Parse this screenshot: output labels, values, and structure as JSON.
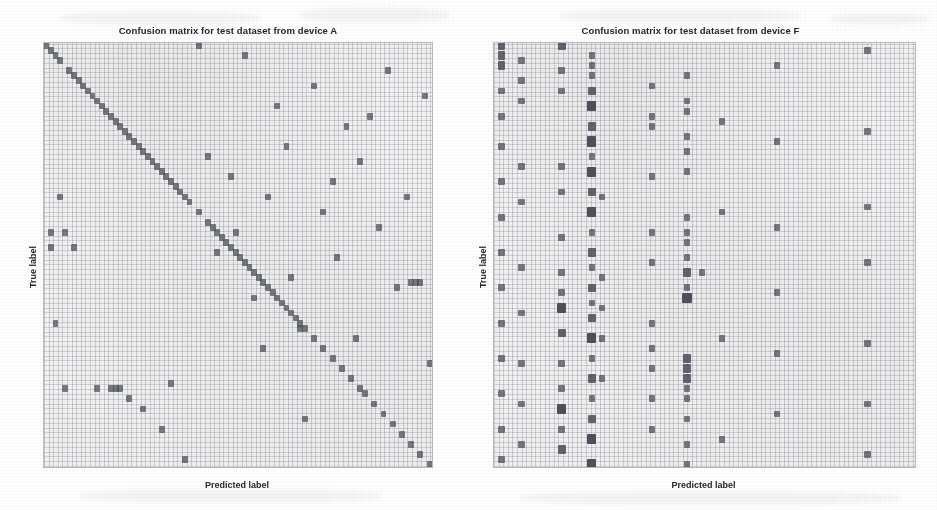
{
  "figure": {
    "background_color": "#ffffff",
    "cell_color": "#4a4e57",
    "grid_color": "#b9bcc1",
    "plot_face_color": "#f6f6f6"
  },
  "panels": [
    {
      "id": "panel-a",
      "title": "Confusion matrix for test dataset from device A",
      "xlabel": "Predicted label",
      "ylabel": "True label"
    },
    {
      "id": "panel-f",
      "title": "Confusion matrix for test dataset from device F",
      "xlabel": "Predicted label",
      "ylabel": "True label"
    }
  ],
  "chart_data": [
    {
      "type": "heatmap",
      "title": "Confusion matrix for test dataset from device A",
      "xlabel": "Predicted label",
      "ylabel": "True label",
      "grid": true,
      "legend": "none",
      "xtick_labels": [],
      "ytick_labels": [],
      "n_classes": 84,
      "xlim": [
        0,
        84
      ],
      "ylim": [
        0,
        84
      ],
      "value_scale": "counts (dark = higher)",
      "description": "Strong dark main diagonal indicating mostly correct predictions, with sparse scattered off-diagonal confusions.",
      "points": [
        [
          0,
          0,
          1
        ],
        [
          1,
          1,
          1
        ],
        [
          2,
          2,
          1
        ],
        [
          3,
          3,
          1
        ],
        [
          5,
          5,
          1
        ],
        [
          6,
          6,
          1
        ],
        [
          7,
          7,
          1
        ],
        [
          8,
          8,
          1
        ],
        [
          9,
          9,
          1
        ],
        [
          10,
          10,
          1
        ],
        [
          11,
          11,
          1
        ],
        [
          12,
          12,
          1
        ],
        [
          13,
          13,
          1
        ],
        [
          14,
          14,
          1
        ],
        [
          15,
          15,
          1
        ],
        [
          16,
          16,
          1
        ],
        [
          17,
          17,
          1
        ],
        [
          18,
          18,
          1
        ],
        [
          19,
          19,
          1
        ],
        [
          20,
          20,
          1
        ],
        [
          21,
          21,
          1
        ],
        [
          22,
          22,
          1
        ],
        [
          23,
          23,
          1
        ],
        [
          24,
          24,
          1
        ],
        [
          25,
          25,
          1
        ],
        [
          26,
          26,
          1
        ],
        [
          27,
          27,
          1
        ],
        [
          28,
          28,
          1
        ],
        [
          29,
          29,
          1
        ],
        [
          30,
          30,
          1
        ],
        [
          31,
          31,
          1
        ],
        [
          33,
          33,
          1
        ],
        [
          35,
          35,
          1
        ],
        [
          36,
          36,
          1
        ],
        [
          37,
          37,
          1
        ],
        [
          38,
          38,
          1
        ],
        [
          39,
          39,
          1
        ],
        [
          40,
          40,
          1
        ],
        [
          41,
          41,
          1
        ],
        [
          42,
          42,
          1
        ],
        [
          43,
          43,
          1
        ],
        [
          44,
          44,
          1
        ],
        [
          45,
          45,
          1
        ],
        [
          46,
          46,
          1
        ],
        [
          47,
          47,
          1
        ],
        [
          48,
          48,
          1
        ],
        [
          49,
          49,
          1
        ],
        [
          50,
          50,
          1
        ],
        [
          51,
          51,
          1
        ],
        [
          52,
          52,
          1
        ],
        [
          53,
          53,
          1
        ],
        [
          54,
          54,
          1
        ],
        [
          55,
          55,
          1
        ],
        [
          56,
          56,
          1
        ],
        [
          58,
          58,
          1
        ],
        [
          60,
          60,
          1
        ],
        [
          62,
          62,
          1
        ],
        [
          64,
          64,
          1
        ],
        [
          66,
          66,
          1
        ],
        [
          68,
          68,
          1
        ],
        [
          69,
          69,
          1
        ],
        [
          71,
          71,
          1
        ],
        [
          73,
          73,
          1
        ],
        [
          75,
          75,
          1
        ],
        [
          77,
          77,
          1
        ],
        [
          79,
          79,
          1
        ],
        [
          81,
          81,
          1
        ],
        [
          83,
          83,
          1
        ],
        [
          1,
          37,
          1
        ],
        [
          1,
          40,
          1
        ],
        [
          2,
          55,
          1
        ],
        [
          3,
          30,
          1
        ],
        [
          4,
          68,
          1
        ],
        [
          4,
          37,
          1
        ],
        [
          6,
          40,
          1
        ],
        [
          11,
          68,
          1
        ],
        [
          14,
          68,
          1
        ],
        [
          15,
          68,
          1
        ],
        [
          16,
          68,
          1
        ],
        [
          18,
          70,
          1
        ],
        [
          21,
          72,
          1
        ],
        [
          25,
          76,
          1
        ],
        [
          27,
          67,
          1
        ],
        [
          30,
          82,
          1
        ],
        [
          33,
          0,
          1
        ],
        [
          35,
          22,
          1
        ],
        [
          37,
          41,
          1
        ],
        [
          40,
          26,
          1
        ],
        [
          41,
          37,
          1
        ],
        [
          43,
          2,
          1
        ],
        [
          45,
          50,
          1
        ],
        [
          47,
          60,
          1
        ],
        [
          48,
          30,
          1
        ],
        [
          50,
          12,
          1
        ],
        [
          52,
          20,
          1
        ],
        [
          53,
          46,
          1
        ],
        [
          55,
          56,
          1
        ],
        [
          56,
          74,
          1
        ],
        [
          58,
          8,
          1
        ],
        [
          60,
          33,
          1
        ],
        [
          62,
          27,
          1
        ],
        [
          63,
          42,
          1
        ],
        [
          65,
          16,
          1
        ],
        [
          67,
          58,
          1
        ],
        [
          68,
          23,
          1
        ],
        [
          70,
          14,
          1
        ],
        [
          72,
          36,
          1
        ],
        [
          74,
          5,
          1
        ],
        [
          76,
          48,
          1
        ],
        [
          78,
          30,
          1
        ],
        [
          79,
          47,
          1
        ],
        [
          80,
          47,
          1
        ],
        [
          81,
          47,
          1
        ],
        [
          82,
          10,
          1
        ],
        [
          83,
          63,
          1
        ]
      ]
    },
    {
      "type": "heatmap",
      "title": "Confusion matrix for test dataset from device F",
      "xlabel": "Predicted label",
      "ylabel": "True label",
      "grid": true,
      "legend": "none",
      "xtick_labels": [],
      "ytick_labels": [],
      "n_classes": 84,
      "xlim": [
        0,
        84
      ],
      "ylim": [
        0,
        84
      ],
      "value_scale": "counts (dark = higher)",
      "description": "No visible diagonal; predictions collapse onto a small number of columns producing dense dark vertical bands, indicating severe domain shift / misclassification.",
      "dominant_predicted_columns": [
        1,
        5,
        13,
        19,
        21,
        31,
        38,
        45,
        56,
        74
      ],
      "points": [
        [
          1,
          0,
          2
        ],
        [
          1,
          2,
          2
        ],
        [
          1,
          4,
          2
        ],
        [
          1,
          9,
          1
        ],
        [
          1,
          14,
          1
        ],
        [
          1,
          20,
          1
        ],
        [
          1,
          27,
          1
        ],
        [
          1,
          34,
          1
        ],
        [
          1,
          41,
          1
        ],
        [
          1,
          48,
          1
        ],
        [
          1,
          55,
          1
        ],
        [
          1,
          62,
          1
        ],
        [
          1,
          69,
          1
        ],
        [
          1,
          76,
          1
        ],
        [
          1,
          82,
          1
        ],
        [
          5,
          3,
          1
        ],
        [
          5,
          7,
          1
        ],
        [
          5,
          11,
          1
        ],
        [
          5,
          24,
          1
        ],
        [
          5,
          31,
          1
        ],
        [
          5,
          44,
          1
        ],
        [
          5,
          53,
          1
        ],
        [
          5,
          63,
          1
        ],
        [
          5,
          71,
          1
        ],
        [
          5,
          79,
          1
        ],
        [
          13,
          0,
          2
        ],
        [
          13,
          5,
          1
        ],
        [
          13,
          9,
          1
        ],
        [
          13,
          24,
          1
        ],
        [
          13,
          29,
          1
        ],
        [
          13,
          38,
          1
        ],
        [
          13,
          45,
          1
        ],
        [
          13,
          49,
          1
        ],
        [
          13,
          52,
          3
        ],
        [
          13,
          57,
          2
        ],
        [
          13,
          63,
          1
        ],
        [
          13,
          68,
          1
        ],
        [
          13,
          72,
          3
        ],
        [
          13,
          76,
          1
        ],
        [
          13,
          80,
          2
        ],
        [
          19,
          2,
          1
        ],
        [
          19,
          4,
          1
        ],
        [
          19,
          6,
          1
        ],
        [
          19,
          9,
          2
        ],
        [
          19,
          12,
          3
        ],
        [
          19,
          16,
          2
        ],
        [
          19,
          19,
          3
        ],
        [
          19,
          22,
          1
        ],
        [
          19,
          25,
          3
        ],
        [
          19,
          29,
          2
        ],
        [
          19,
          33,
          3
        ],
        [
          19,
          37,
          1
        ],
        [
          19,
          41,
          2
        ],
        [
          19,
          44,
          1
        ],
        [
          19,
          48,
          2
        ],
        [
          19,
          51,
          1
        ],
        [
          19,
          54,
          2
        ],
        [
          19,
          58,
          3
        ],
        [
          19,
          62,
          1
        ],
        [
          19,
          66,
          2
        ],
        [
          19,
          70,
          1
        ],
        [
          19,
          74,
          2
        ],
        [
          19,
          78,
          3
        ],
        [
          19,
          83,
          3
        ],
        [
          21,
          30,
          1
        ],
        [
          21,
          46,
          1
        ],
        [
          21,
          52,
          1
        ],
        [
          21,
          58,
          1
        ],
        [
          21,
          66,
          1
        ],
        [
          31,
          8,
          1
        ],
        [
          31,
          14,
          1
        ],
        [
          31,
          16,
          1
        ],
        [
          31,
          26,
          1
        ],
        [
          31,
          37,
          1
        ],
        [
          31,
          43,
          1
        ],
        [
          31,
          55,
          1
        ],
        [
          31,
          60,
          1
        ],
        [
          31,
          64,
          1
        ],
        [
          31,
          70,
          1
        ],
        [
          31,
          76,
          1
        ],
        [
          38,
          6,
          1
        ],
        [
          38,
          11,
          1
        ],
        [
          38,
          13,
          1
        ],
        [
          38,
          18,
          1
        ],
        [
          38,
          21,
          1
        ],
        [
          38,
          25,
          1
        ],
        [
          38,
          34,
          1
        ],
        [
          38,
          37,
          1
        ],
        [
          38,
          39,
          1
        ],
        [
          38,
          42,
          1
        ],
        [
          38,
          45,
          2
        ],
        [
          38,
          48,
          1
        ],
        [
          38,
          50,
          3
        ],
        [
          38,
          62,
          2
        ],
        [
          38,
          64,
          2
        ],
        [
          38,
          66,
          2
        ],
        [
          38,
          68,
          1
        ],
        [
          38,
          70,
          1
        ],
        [
          38,
          74,
          1
        ],
        [
          38,
          79,
          1
        ],
        [
          38,
          83,
          1
        ],
        [
          41,
          45,
          1
        ],
        [
          45,
          15,
          1
        ],
        [
          45,
          33,
          1
        ],
        [
          45,
          58,
          1
        ],
        [
          45,
          78,
          1
        ],
        [
          56,
          4,
          1
        ],
        [
          56,
          19,
          1
        ],
        [
          56,
          36,
          1
        ],
        [
          56,
          49,
          1
        ],
        [
          56,
          61,
          1
        ],
        [
          56,
          73,
          1
        ],
        [
          74,
          1,
          1
        ],
        [
          74,
          17,
          1
        ],
        [
          74,
          32,
          1
        ],
        [
          74,
          43,
          1
        ],
        [
          74,
          59,
          1
        ],
        [
          74,
          71,
          1
        ],
        [
          74,
          81,
          1
        ]
      ]
    }
  ]
}
